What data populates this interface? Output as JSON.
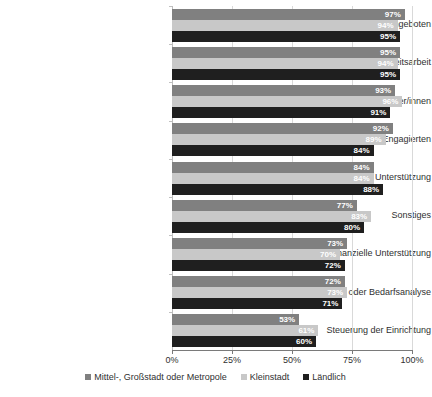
{
  "chart_data": {
    "type": "bar",
    "orientation": "horizontal",
    "title": "",
    "subtitle": "",
    "xlabel": "",
    "ylabel": "",
    "xlim": [
      0,
      100
    ],
    "grid": true,
    "value_suffix": "%",
    "legend_position": "bottom",
    "tick_labels": [
      "0%",
      "25%",
      "50%",
      "75%",
      "100%"
    ],
    "ticks": [
      0,
      25,
      50,
      75,
      100
    ],
    "categories": [
      "Erbringung von Angeboten",
      "Öffentlichkeitsarbeit",
      "Ansprache von Nutzer/innen",
      "Ansprache von Freiwillig Engagierten",
      "Politische/ strategische Unterstützung",
      "Sonstiges",
      "Finanzielle Unterstützung",
      "Konzeption oder Bedarfsanalyse",
      "Steuerung der Einrichtung"
    ],
    "series": [
      {
        "name": "Mittel-, Großstadt oder Metropole",
        "color": "#808080",
        "values": [
          97,
          95,
          93,
          92,
          84,
          77,
          73,
          72,
          53
        ],
        "labels": [
          "97%",
          "95%",
          "93%",
          "92%",
          "84%",
          "77%",
          "73%",
          "72%",
          "53%"
        ]
      },
      {
        "name": "Kleinstadt",
        "color": "#c8c8c8",
        "values": [
          94,
          94,
          96,
          89,
          84,
          83,
          70,
          73,
          61
        ],
        "labels": [
          "94%",
          "94%",
          "96%",
          "89%",
          "84%",
          "83%",
          "70%",
          "73%",
          "61%"
        ]
      },
      {
        "name": "Ländlich",
        "color": "#1f1f1f",
        "values": [
          95,
          95,
          91,
          84,
          88,
          80,
          72,
          71,
          60
        ],
        "labels": [
          "95%",
          "95%",
          "91%",
          "84%",
          "88%",
          "80%",
          "72%",
          "71%",
          "60%"
        ]
      }
    ]
  },
  "legend": {
    "items": [
      {
        "label": "Mittel-, Großstadt oder Metropole",
        "swatch": "series-0-swatch"
      },
      {
        "label": "Kleinstadt",
        "swatch": "series-1-swatch"
      },
      {
        "label": "Ländlich",
        "swatch": "series-2-swatch"
      }
    ]
  }
}
